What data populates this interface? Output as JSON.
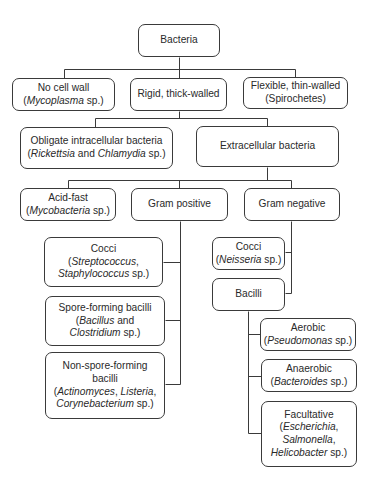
{
  "line_color": "#3a3a3a",
  "nodes": [
    {
      "id": "bacteria",
      "x": 138,
      "y": 24,
      "w": 82,
      "h": 33,
      "lines": [
        [
          [
            "Bacteria",
            false
          ]
        ]
      ]
    },
    {
      "id": "no-cell-wall",
      "x": 12,
      "y": 78,
      "w": 103,
      "h": 33,
      "lines": [
        [
          [
            "No cell wall",
            false
          ]
        ],
        [
          [
            "(",
            false
          ],
          [
            "Mycoplasma",
            true
          ],
          [
            " sp.)",
            false
          ]
        ]
      ]
    },
    {
      "id": "rigid",
      "x": 130,
      "y": 78,
      "w": 97,
      "h": 33,
      "lines": [
        [
          [
            "Rigid, thick-walled",
            false
          ]
        ]
      ]
    },
    {
      "id": "flexible",
      "x": 243,
      "y": 77,
      "w": 105,
      "h": 32,
      "lines": [
        [
          [
            "Flexible, thin-walled",
            false
          ]
        ],
        [
          [
            "(Spirochetes)",
            false
          ]
        ]
      ]
    },
    {
      "id": "obligate",
      "x": 20,
      "y": 127,
      "w": 153,
      "h": 42,
      "lines": [
        [
          [
            "Obligate intracellular bacteria",
            false
          ]
        ],
        [
          [
            "(",
            false
          ],
          [
            "Rickettsia",
            true
          ],
          [
            " and ",
            false
          ],
          [
            "Chlamydia",
            true
          ],
          [
            " sp.)",
            false
          ]
        ]
      ]
    },
    {
      "id": "extracellular",
      "x": 196,
      "y": 126,
      "w": 143,
      "h": 41,
      "lines": [
        [
          [
            "Extracellular bacteria",
            false
          ]
        ]
      ]
    },
    {
      "id": "acid-fast",
      "x": 20,
      "y": 188,
      "w": 96,
      "h": 33,
      "lines": [
        [
          [
            "Acid-fast",
            false
          ]
        ],
        [
          [
            "(",
            false
          ],
          [
            "Mycobacteria",
            true
          ],
          [
            " sp.)",
            false
          ]
        ]
      ]
    },
    {
      "id": "gram-positive",
      "x": 131,
      "y": 188,
      "w": 97,
      "h": 33,
      "lines": [
        [
          [
            "Gram positive",
            false
          ]
        ]
      ]
    },
    {
      "id": "gram-negative",
      "x": 244,
      "y": 188,
      "w": 96,
      "h": 33,
      "lines": [
        [
          [
            "Gram negative",
            false
          ]
        ]
      ]
    },
    {
      "id": "cocci-positive",
      "x": 44,
      "y": 237,
      "w": 119,
      "h": 50,
      "lines": [
        [
          [
            "Cocci",
            false
          ]
        ],
        [
          [
            "(",
            false
          ],
          [
            "Streptococcus",
            true
          ],
          [
            ",",
            false
          ]
        ],
        [
          [
            "Staphylococcus",
            true
          ],
          [
            " sp.)",
            false
          ]
        ]
      ]
    },
    {
      "id": "spore-forming",
      "x": 45,
      "y": 296,
      "w": 120,
      "h": 50,
      "lines": [
        [
          [
            "Spore-forming bacilli",
            false
          ]
        ],
        [
          [
            "(",
            false
          ],
          [
            "Bacillus",
            true
          ],
          [
            " and",
            false
          ]
        ],
        [
          [
            "Clostridium",
            true
          ],
          [
            " sp.)",
            false
          ]
        ]
      ]
    },
    {
      "id": "non-spore-forming",
      "x": 45,
      "y": 352,
      "w": 120,
      "h": 67,
      "lines": [
        [
          [
            "Non-spore-forming",
            false
          ]
        ],
        [
          [
            "bacilli",
            false
          ]
        ],
        [
          [
            "(",
            false
          ],
          [
            "Actinomyces",
            true
          ],
          [
            ", ",
            false
          ],
          [
            "Listeria",
            true
          ],
          [
            ",",
            false
          ]
        ],
        [
          [
            "Corynebacterium",
            true
          ],
          [
            " sp.)",
            false
          ]
        ]
      ]
    },
    {
      "id": "cocci-negative",
      "x": 212,
      "y": 237,
      "w": 73,
      "h": 33,
      "lines": [
        [
          [
            "Cocci",
            false
          ]
        ],
        [
          [
            "(",
            false
          ],
          [
            "Neisseria",
            true
          ],
          [
            " sp.)",
            false
          ]
        ]
      ]
    },
    {
      "id": "bacilli",
      "x": 212,
      "y": 278,
      "w": 73,
      "h": 33,
      "lines": [
        [
          [
            "Bacilli",
            false
          ]
        ]
      ]
    },
    {
      "id": "aerobic",
      "x": 260,
      "y": 318,
      "w": 96,
      "h": 33,
      "lines": [
        [
          [
            "Aerobic",
            false
          ]
        ],
        [
          [
            "(",
            false
          ],
          [
            "Pseudomonas",
            true
          ],
          [
            " sp.)",
            false
          ]
        ]
      ]
    },
    {
      "id": "anaerobic",
      "x": 261,
      "y": 359,
      "w": 96,
      "h": 33,
      "lines": [
        [
          [
            "Anaerobic",
            false
          ]
        ],
        [
          [
            "(",
            false
          ],
          [
            "Bacteroides",
            true
          ],
          [
            " sp.)",
            false
          ]
        ]
      ]
    },
    {
      "id": "facultative",
      "x": 261,
      "y": 401,
      "w": 96,
      "h": 66,
      "lines": [
        [
          [
            "Facultative",
            false
          ]
        ],
        [
          [
            "(",
            false
          ],
          [
            "Escherichia",
            true
          ],
          [
            ",",
            false
          ]
        ],
        [
          [
            "Salmonella",
            true
          ],
          [
            ",",
            false
          ]
        ],
        [
          [
            "Helicobacter",
            true
          ],
          [
            " sp.)",
            false
          ]
        ]
      ]
    }
  ],
  "connectors": [
    [
      [
        179,
        57
      ],
      [
        179,
        69
      ]
    ],
    [
      [
        64,
        69
      ],
      [
        295,
        69
      ]
    ],
    [
      [
        64,
        69
      ],
      [
        64,
        78
      ]
    ],
    [
      [
        179,
        69
      ],
      [
        179,
        78
      ]
    ],
    [
      [
        295,
        69
      ],
      [
        295,
        77
      ]
    ],
    [
      [
        179,
        111
      ],
      [
        179,
        118
      ]
    ],
    [
      [
        95,
        118
      ],
      [
        267,
        118
      ]
    ],
    [
      [
        95,
        118
      ],
      [
        95,
        127
      ]
    ],
    [
      [
        267,
        118
      ],
      [
        267,
        126
      ]
    ],
    [
      [
        267,
        167
      ],
      [
        267,
        180
      ]
    ],
    [
      [
        68,
        180
      ],
      [
        291,
        180
      ]
    ],
    [
      [
        68,
        180
      ],
      [
        68,
        188
      ]
    ],
    [
      [
        179,
        180
      ],
      [
        179,
        188
      ]
    ],
    [
      [
        291,
        180
      ],
      [
        291,
        188
      ]
    ],
    [
      [
        180,
        221
      ],
      [
        180,
        384
      ]
    ],
    [
      [
        163,
        262
      ],
      [
        180,
        262
      ]
    ],
    [
      [
        165,
        320
      ],
      [
        180,
        320
      ]
    ],
    [
      [
        165,
        384
      ],
      [
        180,
        384
      ]
    ],
    [
      [
        291,
        221
      ],
      [
        291,
        293
      ]
    ],
    [
      [
        285,
        252
      ],
      [
        291,
        252
      ]
    ],
    [
      [
        285,
        293
      ],
      [
        291,
        293
      ]
    ],
    [
      [
        248,
        311
      ],
      [
        248,
        433
      ]
    ],
    [
      [
        248,
        334
      ],
      [
        260,
        334
      ]
    ],
    [
      [
        248,
        376
      ],
      [
        261,
        376
      ]
    ],
    [
      [
        248,
        433
      ],
      [
        261,
        433
      ]
    ]
  ]
}
